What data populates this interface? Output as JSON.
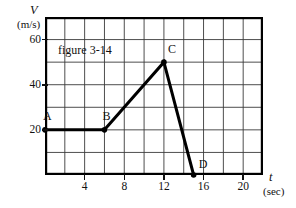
{
  "chart_data": {
    "type": "line",
    "title": "figure 3-14",
    "xlabel": "t",
    "x_unit": "(sec)",
    "ylabel": "V",
    "y_unit": "(m/s)",
    "xlim": [
      0,
      22
    ],
    "ylim": [
      0,
      70
    ],
    "grid": true,
    "x_major_step": 2,
    "y_major_step": 10,
    "x_tick_labels": [
      "4",
      "8",
      "12",
      "16",
      "20"
    ],
    "x_tick_values": [
      4,
      8,
      12,
      16,
      20
    ],
    "y_tick_labels": [
      "20",
      "40",
      "60"
    ],
    "y_tick_values": [
      20,
      40,
      60
    ],
    "legend": null,
    "series": [
      {
        "name": "velocity",
        "x": [
          0,
          6,
          12,
          15
        ],
        "values": [
          20,
          20,
          50,
          0
        ],
        "point_labels": [
          "A",
          "B",
          "C",
          "D"
        ]
      }
    ],
    "annotations": [
      {
        "text": "figure 3-14",
        "x": 1.2,
        "y": 61
      }
    ]
  },
  "axes": {
    "y_symbol": "V",
    "y_unit": "(m/s)",
    "x_symbol": "t",
    "x_unit": "(sec)"
  },
  "ticks": {
    "y": [
      {
        "label": "20",
        "value": 20
      },
      {
        "label": "40",
        "value": 40
      },
      {
        "label": "60",
        "value": 60
      }
    ],
    "x": [
      {
        "label": "4",
        "value": 4
      },
      {
        "label": "8",
        "value": 8
      },
      {
        "label": "12",
        "value": 12
      },
      {
        "label": "16",
        "value": 16
      },
      {
        "label": "20",
        "value": 20
      }
    ]
  },
  "points": [
    {
      "label": "A",
      "t": 0,
      "v": 20
    },
    {
      "label": "B",
      "t": 6,
      "v": 20
    },
    {
      "label": "C",
      "t": 12,
      "v": 50
    },
    {
      "label": "D",
      "t": 15,
      "v": 0
    }
  ],
  "caption": {
    "text": "figure 3-14"
  },
  "colors": {
    "ink": "#111111",
    "grid": "#3a3a3a",
    "border": "#000000",
    "background": "#ffffff"
  }
}
